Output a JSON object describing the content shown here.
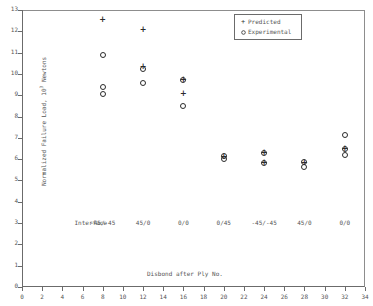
{
  "chart_data": {
    "type": "scatter",
    "title": "",
    "xlabel": "Disbond after Ply No.",
    "ylabel": "Normalized Failure Load, 10^3 Newtons",
    "ylabel_base": "Normalized Failure Load, 10",
    "ylabel_exponent": "3",
    "ylabel_unit": " Newtons",
    "xlim": [
      0,
      34
    ],
    "ylim": [
      0,
      13
    ],
    "xticks": [
      0,
      2,
      4,
      6,
      8,
      10,
      12,
      14,
      16,
      18,
      20,
      22,
      24,
      26,
      28,
      30,
      32,
      34
    ],
    "yticks": [
      0,
      1,
      2,
      3,
      4,
      5,
      6,
      7,
      8,
      9,
      10,
      11,
      12,
      13
    ],
    "grid": false,
    "legend_position": "top-right",
    "legend": [
      {
        "marker": "+",
        "label": "Predicted"
      },
      {
        "marker": "o",
        "label": "Experimental"
      }
    ],
    "series": [
      {
        "name": "Predicted",
        "marker": "+",
        "points": [
          {
            "x": 8,
            "y": 12.55
          },
          {
            "x": 12,
            "y": 12.05
          },
          {
            "x": 12,
            "y": 10.32
          },
          {
            "x": 16,
            "y": 9.73
          },
          {
            "x": 16,
            "y": 9.08
          },
          {
            "x": 20,
            "y": 6.12
          },
          {
            "x": 24,
            "y": 6.28
          },
          {
            "x": 24,
            "y": 5.84
          },
          {
            "x": 28,
            "y": 5.82
          },
          {
            "x": 32,
            "y": 6.5
          }
        ]
      },
      {
        "name": "Experimental",
        "marker": "o",
        "points": [
          {
            "x": 8,
            "y": 10.87
          },
          {
            "x": 8,
            "y": 9.38
          },
          {
            "x": 8,
            "y": 9.06
          },
          {
            "x": 12,
            "y": 10.25
          },
          {
            "x": 12,
            "y": 9.58
          },
          {
            "x": 16,
            "y": 9.7
          },
          {
            "x": 16,
            "y": 8.5
          },
          {
            "x": 20,
            "y": 6.16
          },
          {
            "x": 20,
            "y": 6.03
          },
          {
            "x": 24,
            "y": 6.3
          },
          {
            "x": 24,
            "y": 5.82
          },
          {
            "x": 28,
            "y": 5.85
          },
          {
            "x": 28,
            "y": 5.62
          },
          {
            "x": 32,
            "y": 7.12
          },
          {
            "x": 32,
            "y": 6.47
          },
          {
            "x": 32,
            "y": 6.2
          }
        ]
      }
    ],
    "annotations": {
      "row_title": "Interface",
      "row_title_x": 5.2,
      "row_y": 3.0,
      "items": [
        {
          "x": 8,
          "label": "-45/-45"
        },
        {
          "x": 12,
          "label": "45/0"
        },
        {
          "x": 16,
          "label": "0/0"
        },
        {
          "x": 20,
          "label": "0/45"
        },
        {
          "x": 24,
          "label": "-45/-45"
        },
        {
          "x": 28,
          "label": "45/0"
        },
        {
          "x": 32,
          "label": "0/0"
        }
      ]
    }
  }
}
